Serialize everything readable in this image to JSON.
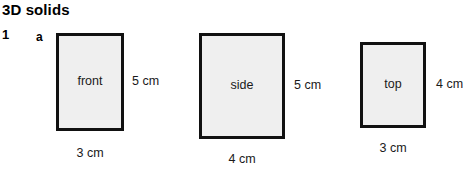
{
  "heading": {
    "title": "3D solids"
  },
  "exercise": {
    "question_number": "1",
    "part_label": "a"
  },
  "style": {
    "face_fill": "#efefef",
    "stroke": "#111111",
    "text": "#1a1a1a"
  },
  "figures": [
    {
      "face": "front",
      "width_label": "3 cm",
      "height_label": "5 cm",
      "box": {
        "left": 56,
        "top": 33,
        "width": 68,
        "height": 98
      },
      "height_label_pos": {
        "left": 76,
        "top": 41
      },
      "width_label_pos": {
        "top": 15
      }
    },
    {
      "face": "side",
      "width_label": "4 cm",
      "height_label": "5 cm",
      "box": {
        "left": 199,
        "top": 33,
        "width": 86,
        "height": 106
      },
      "height_label_pos": {
        "left": 95,
        "top": 45
      },
      "width_label_pos": {
        "top": 13
      }
    },
    {
      "face": "top",
      "width_label": "3 cm",
      "height_label": "4 cm",
      "box": {
        "left": 360,
        "top": 42,
        "width": 66,
        "height": 86
      },
      "height_label_pos": {
        "left": 76,
        "top": 35
      },
      "width_label_pos": {
        "top": 13
      }
    }
  ]
}
